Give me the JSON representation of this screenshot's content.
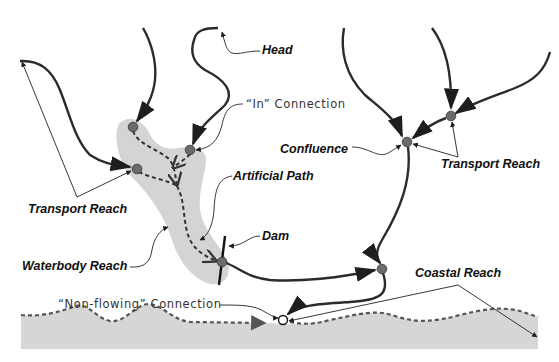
{
  "diagram": {
    "title": "",
    "labels": {
      "head": "Head",
      "in_connection": "“In” Connection",
      "confluence": "Confluence",
      "transport_reach_left": "Transport Reach",
      "transport_reach_right": "Transport Reach",
      "artificial_path": "Artificial Path",
      "dam": "Dam",
      "waterbody_reach": "Waterbody Reach",
      "coastal_reach": "Coastal Reach",
      "non_flowing_connection": "“Non-flowing” Connection"
    },
    "colors": {
      "stream": "#2b2b2b",
      "node": "#6b6b6b",
      "waterbody_fill": "#d4d4d4",
      "coast_fill": "#d6d6d6",
      "coast_line": "#5a5a5a",
      "leader": "#222222"
    },
    "nodes": [
      {
        "id": "upper-left-junction",
        "x": 133,
        "y": 127
      },
      {
        "id": "left-junction",
        "x": 137,
        "y": 169
      },
      {
        "id": "in-connection-node",
        "x": 190,
        "y": 150
      },
      {
        "id": "dam-node",
        "x": 222,
        "y": 262
      },
      {
        "id": "lower-right-junction",
        "x": 382,
        "y": 269
      },
      {
        "id": "confluence-node",
        "x": 407,
        "y": 142
      },
      {
        "id": "upper-right-junction",
        "x": 451,
        "y": 116
      },
      {
        "id": "non-flowing-node",
        "x": 283,
        "y": 320,
        "style": "hollow"
      }
    ]
  }
}
